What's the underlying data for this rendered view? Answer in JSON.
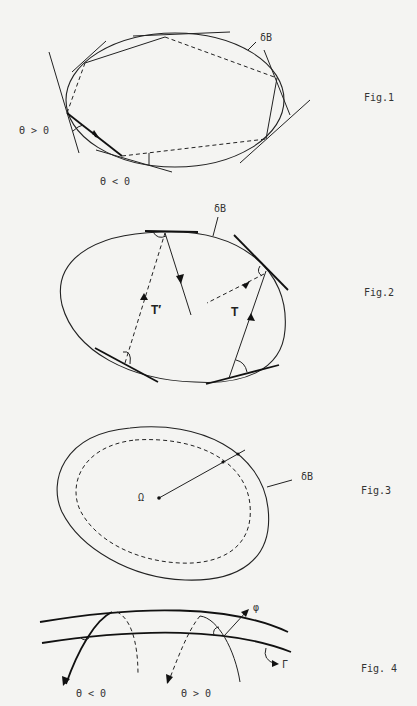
{
  "figures": [
    {
      "id": "fig1",
      "caption": "Fig.1",
      "boundary_label": "δB",
      "angle_labels": [
        "Θ > 0",
        "Θ < 0"
      ]
    },
    {
      "id": "fig2",
      "caption": "Fig.2",
      "boundary_label": "δB",
      "path_labels": [
        "T′",
        "T"
      ]
    },
    {
      "id": "fig3",
      "caption": "Fig.3",
      "boundary_label": "δB",
      "center_label": "Ω"
    },
    {
      "id": "fig4",
      "caption": "Fig. 4",
      "angle_labels": [
        "Θ < 0",
        "Θ > 0"
      ],
      "vector_label": "φ",
      "curve_label": "Γ"
    }
  ]
}
